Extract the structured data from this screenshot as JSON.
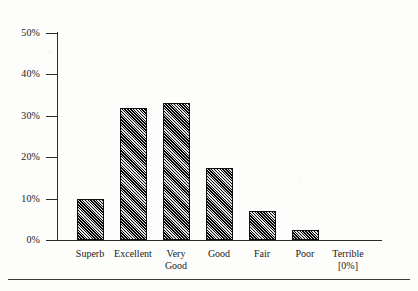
{
  "chart_data": {
    "type": "bar",
    "title": "",
    "subtitle": "",
    "xlabel": "",
    "ylabel": "",
    "ylim": [
      0,
      50
    ],
    "grid": false,
    "legend": null,
    "categories": [
      "Superb",
      "Excellent",
      "Very Good",
      "Good",
      "Fair",
      "Poor",
      "Terrible"
    ],
    "category_lines": [
      [
        "Superb",
        ""
      ],
      [
        "Excellent",
        ""
      ],
      [
        "Very",
        "Good"
      ],
      [
        "Good",
        ""
      ],
      [
        "Fair",
        ""
      ],
      [
        "Poor",
        ""
      ],
      [
        "Terrible",
        "[0%]"
      ]
    ],
    "values": [
      10,
      32,
      33,
      17.5,
      7,
      2.5,
      0
    ],
    "value_labels": [
      "10%",
      "32%",
      "33%",
      "17.5%",
      "7%",
      "2.5%",
      "0%"
    ],
    "y_ticks": [
      0,
      10,
      20,
      30,
      40,
      50
    ],
    "y_tick_labels": [
      "0%",
      "10%",
      "20%",
      "30%",
      "40%",
      "50%"
    ],
    "annotations": [
      "[0%]"
    ],
    "bar_fill": "diagonal-crosshatch",
    "colors": {
      "bar_outline": "#111111",
      "bar_fill": "#6a6a6a",
      "axis": "#2b2b2b",
      "text": "#1a1a1a",
      "background": "#fdfdfb"
    }
  }
}
